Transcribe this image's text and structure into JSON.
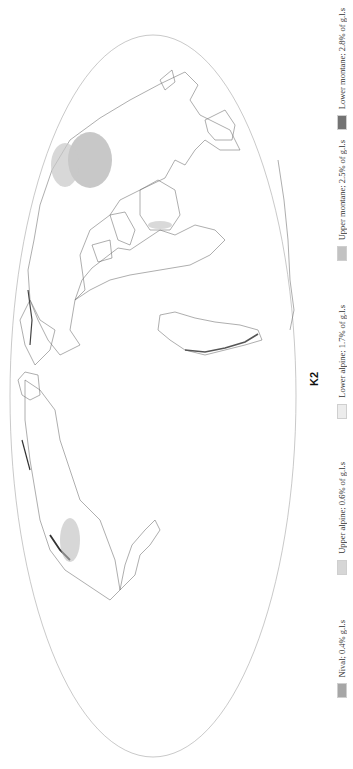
{
  "title": "K2",
  "projection": "Mollweide (rotated 90° clockwise)",
  "colors": {
    "background": "#ffffff",
    "coastline": "#555555",
    "outline": "#9a9a9a"
  },
  "legend": [
    {
      "label": "Nival; 0.4% g.l.s",
      "color": "#a6a6a6",
      "top": 690
    },
    {
      "label": "Upper alpine; 0.6% of g.l.s",
      "color": "#d6d6d6",
      "top": 525
    },
    {
      "label": "Lower alpine; 1.7% of g.l.s",
      "color": "#ececec",
      "top": 345
    },
    {
      "label": "Upper montane; 2.5% of g.l.s",
      "color": "#c2c2c2",
      "top": 160
    },
    {
      "label": "Lower montane; 2.8% of g.l.s",
      "color": "#737373",
      "top": 8
    }
  ]
}
